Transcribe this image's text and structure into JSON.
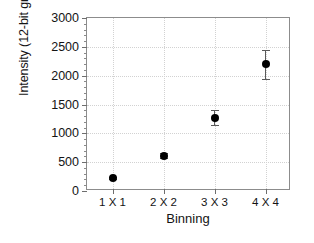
{
  "chart_data": {
    "type": "scatter",
    "title": "",
    "xlabel": "Binning",
    "ylabel": "Intensity (12-bit grey levels)",
    "categories": [
      "1 X 1",
      "2 X 2",
      "3 X 3",
      "4 X 4"
    ],
    "values": [
      225,
      610,
      1270,
      2200
    ],
    "errors": [
      20,
      45,
      130,
      250
    ],
    "ylim": [
      0,
      3000
    ],
    "ytick_labels": [
      "0",
      "500",
      "1000",
      "1500",
      "2000",
      "2500",
      "3000"
    ],
    "ytick_values": [
      0,
      500,
      1000,
      1500,
      2000,
      2500,
      3000
    ],
    "yminor_step": 100,
    "grid": true,
    "legend": "none",
    "marker": "filled-circle",
    "marker_color": "#000000",
    "grid_color": "#d2d2d2",
    "axis_color": "#8c8c8c"
  }
}
